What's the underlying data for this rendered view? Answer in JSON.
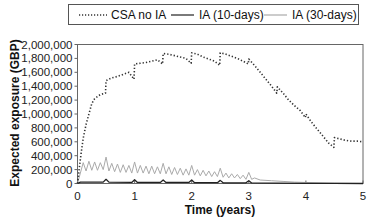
{
  "chart_data": {
    "type": "line",
    "title": "",
    "xlabel": "Time (years)",
    "ylabel": "Expected exposure (GBP)",
    "xlim": [
      0,
      5
    ],
    "ylim": [
      0,
      2000000
    ],
    "x_ticks": [
      "0",
      "1",
      "2",
      "3",
      "4",
      "5"
    ],
    "y_ticks": [
      "0",
      "200,000",
      "400,000",
      "600,000",
      "800,000",
      "1,000,000",
      "1,200,000",
      "1,400,000",
      "1,600,000",
      "1,800,000",
      "2,000,000"
    ],
    "grid": false,
    "legend_position": "top",
    "legend": [
      "CSA no IA",
      "IA (10-days)",
      "IA (30-days)"
    ],
    "series": [
      {
        "name": "CSA no IA",
        "style": "dotted",
        "color": "#333333",
        "x": [
          0,
          0.05,
          0.1,
          0.15,
          0.2,
          0.25,
          0.3,
          0.4,
          0.49,
          0.5,
          0.6,
          0.7,
          0.8,
          0.9,
          0.99,
          1.0,
          1.1,
          1.2,
          1.3,
          1.4,
          1.49,
          1.5,
          1.6,
          1.7,
          1.8,
          1.9,
          1.99,
          2.0,
          2.1,
          2.2,
          2.3,
          2.4,
          2.49,
          2.5,
          2.6,
          2.7,
          2.8,
          2.9,
          2.99,
          3.0,
          3.1,
          3.2,
          3.3,
          3.4,
          3.49,
          3.5,
          3.6,
          3.7,
          3.8,
          3.9,
          3.99,
          4.0,
          4.1,
          4.2,
          4.3,
          4.4,
          4.49,
          4.5,
          4.6,
          4.7,
          4.8,
          4.9,
          5.0
        ],
        "values": [
          0,
          350000,
          650000,
          850000,
          1000000,
          1150000,
          1220000,
          1280000,
          1300000,
          1480000,
          1520000,
          1540000,
          1570000,
          1600000,
          1500000,
          1720000,
          1730000,
          1740000,
          1760000,
          1780000,
          1720000,
          1870000,
          1860000,
          1840000,
          1820000,
          1800000,
          1730000,
          1880000,
          1860000,
          1820000,
          1790000,
          1760000,
          1700000,
          1880000,
          1860000,
          1830000,
          1800000,
          1760000,
          1720000,
          1790000,
          1700000,
          1600000,
          1500000,
          1400000,
          1300000,
          1390000,
          1300000,
          1200000,
          1120000,
          1050000,
          950000,
          1000000,
          880000,
          780000,
          680000,
          580000,
          520000,
          660000,
          640000,
          620000,
          610000,
          610000,
          600000
        ]
      },
      {
        "name": "IA (10-days)",
        "style": "solid",
        "color": "#222222",
        "x": [
          0,
          0.05,
          0.45,
          0.5,
          0.55,
          0.95,
          1.0,
          1.05,
          1.45,
          1.5,
          1.55,
          1.95,
          2.0,
          2.05,
          2.45,
          2.5,
          2.55,
          2.95,
          3.0,
          3.05,
          3.5,
          4.0,
          4.5,
          5.0
        ],
        "values": [
          0,
          20000,
          20000,
          60000,
          20000,
          15000,
          55000,
          15000,
          15000,
          50000,
          15000,
          15000,
          50000,
          12000,
          12000,
          45000,
          10000,
          10000,
          40000,
          8000,
          5000,
          3000,
          1000,
          0
        ]
      },
      {
        "name": "IA (30-days)",
        "style": "solid",
        "color": "#aaaaaa",
        "x": [
          0,
          0.05,
          0.1,
          0.15,
          0.2,
          0.25,
          0.3,
          0.35,
          0.4,
          0.45,
          0.5,
          0.55,
          0.6,
          0.65,
          0.7,
          0.75,
          0.8,
          0.85,
          0.9,
          0.95,
          1.0,
          1.05,
          1.1,
          1.15,
          1.2,
          1.25,
          1.3,
          1.35,
          1.4,
          1.45,
          1.5,
          1.55,
          1.6,
          1.65,
          1.7,
          1.75,
          1.8,
          1.85,
          1.9,
          1.95,
          2.0,
          2.05,
          2.1,
          2.15,
          2.2,
          2.25,
          2.3,
          2.35,
          2.4,
          2.45,
          2.5,
          2.55,
          2.6,
          2.65,
          2.7,
          2.75,
          2.8,
          2.85,
          2.9,
          2.95,
          3.0,
          3.05,
          3.1,
          3.2,
          3.4,
          3.6,
          3.8,
          4.0,
          4.5,
          5.0
        ],
        "values": [
          0,
          150000,
          300000,
          180000,
          320000,
          190000,
          310000,
          190000,
          300000,
          200000,
          380000,
          180000,
          290000,
          170000,
          280000,
          160000,
          270000,
          160000,
          260000,
          150000,
          310000,
          150000,
          260000,
          150000,
          250000,
          140000,
          250000,
          140000,
          240000,
          140000,
          290000,
          140000,
          240000,
          130000,
          230000,
          130000,
          220000,
          120000,
          210000,
          120000,
          260000,
          120000,
          200000,
          110000,
          190000,
          110000,
          180000,
          100000,
          170000,
          100000,
          220000,
          90000,
          150000,
          80000,
          140000,
          80000,
          130000,
          70000,
          120000,
          60000,
          160000,
          60000,
          80000,
          50000,
          40000,
          30000,
          20000,
          15000,
          5000,
          0
        ]
      }
    ]
  },
  "legend": {
    "items": [
      {
        "label": "CSA no IA"
      },
      {
        "label": "IA (10-days)"
      },
      {
        "label": "IA (30-days)"
      }
    ]
  },
  "axes": {
    "xlabel": "Time (years)",
    "ylabel": "Expected exposure (GBP)",
    "x_ticks": [
      "0",
      "1",
      "2",
      "3",
      "4",
      "5"
    ],
    "y_ticks": [
      "0",
      "200,000",
      "400,000",
      "600,000",
      "800,000",
      "1,000,000",
      "1,200,000",
      "1,400,000",
      "1,600,000",
      "1,800,000",
      "2,000,000"
    ]
  }
}
